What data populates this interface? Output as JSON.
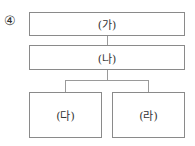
{
  "option_marker": "④",
  "nodes": {
    "top": "(가)",
    "middle": "(나)",
    "left_child": "(다)",
    "right_child": "(라)"
  },
  "colors": {
    "border": "#8a8a8a",
    "connector": "#9a9a9a",
    "text": "#333333"
  }
}
